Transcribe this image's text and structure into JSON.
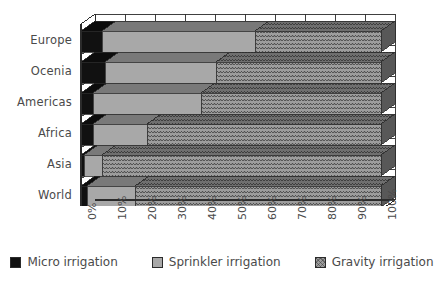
{
  "chart_data": {
    "type": "bar",
    "orientation": "horizontal",
    "stacked": true,
    "stack_mode": "percent",
    "title": "",
    "subtitle": "",
    "xlabel": "",
    "ylabel": "",
    "xlim": [
      0,
      100
    ],
    "grid": true,
    "grid_axis": "x",
    "legend_position": "bottom",
    "style_3d": true,
    "categories": [
      "Europe",
      "Ocenia",
      "Americas",
      "Africa",
      "Asia",
      "World"
    ],
    "x_tick_labels": [
      "0%",
      "10%",
      "20%",
      "30%",
      "40%",
      "50%",
      "60%",
      "70%",
      "80%",
      "90%",
      "100%"
    ],
    "x_tick_values": [
      0,
      10,
      20,
      30,
      40,
      50,
      60,
      70,
      80,
      90,
      100
    ],
    "series": [
      {
        "name": "Micro irrigation",
        "color": "#111111",
        "pattern": "solid",
        "values": [
          7,
          8,
          4,
          4,
          1,
          2
        ]
      },
      {
        "name": "Sprinkler irrigation",
        "color": "#a8a8a8",
        "pattern": "solid",
        "values": [
          51,
          37,
          36,
          18,
          6,
          16
        ]
      },
      {
        "name": "Gravity irrigation",
        "color": "#9d9d9d",
        "pattern": "cross-hatch",
        "values": [
          42,
          55,
          60,
          78,
          93,
          82
        ]
      }
    ],
    "cumulative_boundaries": {
      "Europe": [
        7,
        58,
        100
      ],
      "Ocenia": [
        8,
        45,
        100
      ],
      "Americas": [
        4,
        40,
        100
      ],
      "Africa": [
        4,
        22,
        100
      ],
      "Asia": [
        1,
        7,
        100
      ],
      "World": [
        2,
        18,
        100
      ]
    }
  },
  "legend": {
    "items": [
      {
        "label": "Micro irrigation",
        "swatch": "micro-swatch"
      },
      {
        "label": "Sprinkler irrigation",
        "swatch": "sprinkler-swatch"
      },
      {
        "label": "Gravity irrigation",
        "swatch": "gravity-swatch"
      }
    ]
  }
}
